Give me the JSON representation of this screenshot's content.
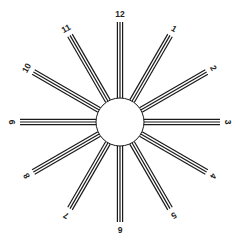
{
  "diagram": {
    "type": "astigmatism-clock-dial",
    "center": [
      120,
      122
    ],
    "hub_radius": 24,
    "ray_inner_radius": 24,
    "ray_outer_radius": 100,
    "label_radius": 108,
    "lines_per_ray": 3,
    "line_spacing": 2.6,
    "line_width": 1.2,
    "line_color": "#1a1a1a",
    "background": "#ffffff",
    "labels": [
      "12",
      "1",
      "2",
      "3",
      "4",
      "5",
      "6",
      "7",
      "8",
      "9",
      "10",
      "11"
    ]
  }
}
